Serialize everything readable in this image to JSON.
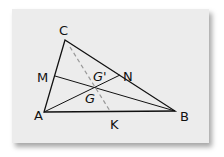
{
  "diagram": {
    "type": "triangle-medians",
    "labels": {
      "C": "C",
      "M": "M",
      "N": "N",
      "G_prime": "G'",
      "G": "G",
      "A": "A",
      "K": "K",
      "B": "B"
    },
    "points": {
      "A": [
        44,
        112
      ],
      "B": [
        175,
        111
      ],
      "C": [
        65,
        40
      ],
      "M": [
        55,
        76
      ],
      "N": [
        120,
        75
      ],
      "K": [
        110,
        111
      ],
      "G": [
        95,
        87
      ]
    },
    "colors": {
      "background": "#ececec",
      "line": "#111111",
      "dashed": "#999999"
    }
  }
}
